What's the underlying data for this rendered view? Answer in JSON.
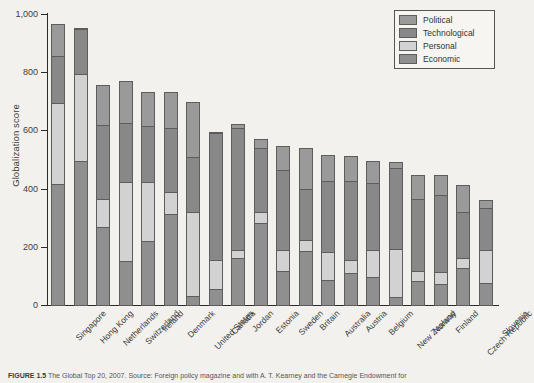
{
  "chart_data": {
    "type": "bar",
    "stacked": true,
    "title": "",
    "xlabel": "",
    "ylabel": "Globalization score",
    "ylim": [
      0,
      1000
    ],
    "ytick_labels": [
      "0",
      "200",
      "400",
      "600",
      "800",
      "1,000"
    ],
    "yticks": [
      0,
      200,
      400,
      600,
      800,
      1000
    ],
    "grid": false,
    "legend_position": "top-right",
    "legend": [
      "Political",
      "Technological",
      "Personal",
      "Economic"
    ],
    "stack_order_bottom_to_top": [
      "Economic",
      "Personal",
      "Technological",
      "Political"
    ],
    "colors": {
      "Political": "#9a9a9a",
      "Technological": "#888888",
      "Personal": "#d2d2d2",
      "Economic": "#8f8f8f"
    },
    "categories": [
      "Singapore",
      "Hong Kong",
      "Netherlands",
      "Switzerland",
      "Ireland",
      "Denmark",
      "United States",
      "Canada",
      "Jordan",
      "Estonia",
      "Sweden",
      "Britain",
      "Australia",
      "Austria",
      "Belgium",
      "New Zealand",
      "Norway",
      "Finland",
      "Czech Republic",
      "Slovenia"
    ],
    "series": [
      {
        "name": "Economic",
        "values": [
          420,
          500,
          270,
          155,
          225,
          315,
          35,
          60,
          165,
          285,
          120,
          190,
          90,
          115,
          100,
          30,
          85,
          75,
          130,
          80
        ]
      },
      {
        "name": "Personal",
        "values": [
          280,
          300,
          100,
          275,
          205,
          80,
          290,
          100,
          30,
          40,
          75,
          40,
          100,
          45,
          95,
          170,
          40,
          45,
          40,
          115
        ]
      },
      {
        "name": "Technological",
        "values": [
          165,
          160,
          260,
          205,
          195,
          225,
          195,
          440,
          425,
          225,
          280,
          180,
          245,
          275,
          235,
          280,
          250,
          270,
          160,
          150
        ]
      },
      {
        "name": "Political",
        "values": [
          115,
          5,
          140,
          150,
          120,
          125,
          190,
          10,
          15,
          35,
          85,
          145,
          95,
          90,
          80,
          25,
          85,
          70,
          95,
          30
        ]
      }
    ],
    "totals": [
      980,
      965,
      770,
      785,
      745,
      745,
      710,
      610,
      635,
      585,
      560,
      555,
      530,
      525,
      510,
      505,
      460,
      460,
      425,
      375
    ]
  },
  "caption": {
    "label": "FIGURE 1.5",
    "text": "The Global Top 20, 2007.  Source: Foreign policy magazine and with A. T. Kearney and the Carnegie Endowment for"
  }
}
